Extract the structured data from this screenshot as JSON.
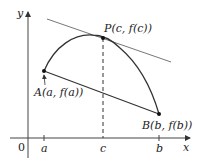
{
  "diagram": {
    "type": "mean-value-theorem",
    "axes": {
      "x_label": "x",
      "y_label": "y",
      "origin_label": "0",
      "ticks": [
        {
          "label": "a"
        },
        {
          "label": "c"
        },
        {
          "label": "b"
        }
      ]
    },
    "points": {
      "A": {
        "label": "A(a, f(a))"
      },
      "P": {
        "label": "P(c, f(c))"
      },
      "B": {
        "label": "B(b, f(b))"
      }
    },
    "elements": [
      "curve y=f(x) from A to B",
      "secant line AB",
      "tangent line at P parallel to AB",
      "dashed vertical line from P to c"
    ],
    "colors": {
      "stroke": "#333333",
      "tangent": "#777777",
      "background": "#ffffff"
    }
  }
}
